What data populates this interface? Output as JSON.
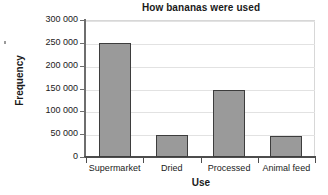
{
  "chart_data": {
    "type": "bar",
    "title": "How bananas were used",
    "xlabel": "Use",
    "ylabel": "Frequency",
    "categories": [
      "Supermarket",
      "Dried",
      "Processed",
      "Animal feed"
    ],
    "values": [
      250000,
      48000,
      147000,
      46000
    ],
    "ylim": [
      0,
      300000
    ],
    "ytick_values": [
      0,
      50000,
      100000,
      150000,
      200000,
      250000,
      300000
    ],
    "ytick_labels": [
      "0",
      "50 000",
      "100 000",
      "150 000",
      "200 000",
      "250 000",
      "300 000"
    ],
    "grid": true,
    "legend": false,
    "bar_color": "#9a9a9a",
    "bar_edge_color": "#3d3d3d",
    "gridline_color": "#e2e2e2",
    "axis_color": "#4d4d4d"
  }
}
